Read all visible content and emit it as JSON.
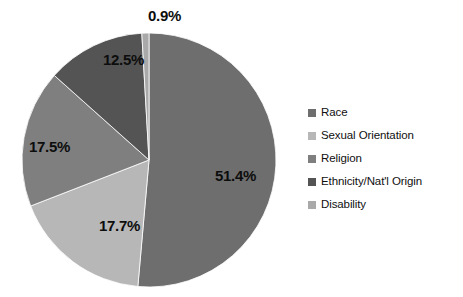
{
  "chart_data": {
    "type": "pie",
    "title": "",
    "subtitle": "",
    "xlabel": "",
    "ylabel": "",
    "grid": false,
    "legend_position": "right",
    "start_angle_deg": 0,
    "direction": "clockwise",
    "center": {
      "x": 149,
      "y": 160
    },
    "radius": 127,
    "categories": [
      "Race",
      "Sexual Orientation",
      "Religion",
      "Ethnicity/Nat'l Origin",
      "Disability"
    ],
    "values": [
      51.4,
      17.7,
      17.5,
      12.5,
      0.9
    ],
    "value_labels": [
      "51.4%",
      "17.7%",
      "17.5%",
      "12.5%",
      "0.9%"
    ],
    "colors": [
      "#6e6e6e",
      "#b7b7b7",
      "#7f7f7f",
      "#545454",
      "#a9a9a9"
    ],
    "slices": [
      {
        "name": "Race",
        "value": 51.4,
        "label": "51.4%",
        "color": "#6e6e6e",
        "start_deg": 0,
        "end_deg": 185.04,
        "label_x": 215,
        "label_y": 168
      },
      {
        "name": "Sexual Orientation",
        "value": 17.7,
        "label": "17.7%",
        "color": "#b7b7b7",
        "start_deg": 185.04,
        "end_deg": 248.76,
        "label_x": 99,
        "label_y": 218
      },
      {
        "name": "Religion",
        "value": 17.5,
        "label": "17.5%",
        "color": "#7f7f7f",
        "start_deg": 248.76,
        "end_deg": 311.76,
        "label_x": 29,
        "label_y": 139
      },
      {
        "name": "Ethnicity/Nat'l Origin",
        "value": 12.5,
        "label": "12.5%",
        "color": "#545454",
        "start_deg": 311.76,
        "end_deg": 356.76,
        "label_x": 103,
        "label_y": 52
      },
      {
        "name": "Disability",
        "value": 0.9,
        "label": "0.9%",
        "color": "#a9a9a9",
        "start_deg": 356.76,
        "end_deg": 360,
        "label_x": 148,
        "label_y": 8
      }
    ]
  },
  "legend": {
    "items": [
      {
        "label": "Race",
        "color": "#6e6e6e"
      },
      {
        "label": "Sexual Orientation",
        "color": "#b7b7b7"
      },
      {
        "label": "Religion",
        "color": "#7f7f7f"
      },
      {
        "label": "Ethnicity/Nat'l Origin",
        "color": "#545454"
      },
      {
        "label": "Disability",
        "color": "#a9a9a9"
      }
    ]
  }
}
